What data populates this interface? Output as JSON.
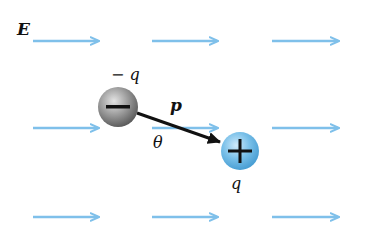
{
  "diagram": {
    "field_label": "E",
    "negative_charge_label": "− q",
    "positive_charge_label": "q",
    "dipole_label": "p",
    "angle_label": "θ",
    "negative_sign": "−",
    "positive_sign": "+",
    "colors": {
      "field_arrow": "#7fc0ea",
      "negative_charge": "#8a8a8a",
      "positive_charge": "#5aaee0",
      "dipole_arrow": "#111111"
    },
    "field_rows_y": [
      41,
      128,
      217
    ],
    "field_columns_x": [
      [
        33,
        98
      ],
      [
        152,
        217
      ],
      [
        272,
        338
      ]
    ],
    "negative_charge_center": [
      118,
      107
    ],
    "positive_charge_center": [
      240,
      151
    ]
  }
}
